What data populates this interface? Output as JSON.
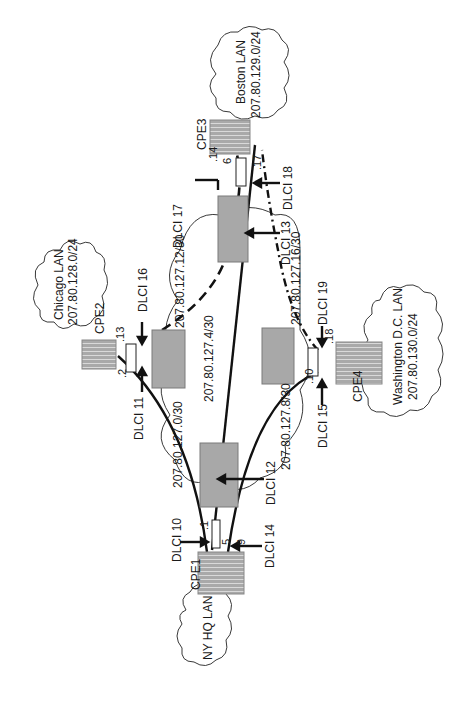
{
  "diagram": {
    "orientation": "rotated 90 degrees counter-clockwise",
    "colors": {
      "device_fill": "#a8a8a8",
      "device_stroke": "#7a7a7a",
      "line": "#111111",
      "background": "#ffffff"
    },
    "lans": [
      {
        "id": "ny",
        "name": "NY HQ LAN",
        "subnet": ""
      },
      {
        "id": "chicago",
        "name": "Chicago LAN",
        "subnet": "207.80.128.0/24"
      },
      {
        "id": "boston",
        "name": "Boston LAN",
        "subnet": "207.80.129.0/24"
      },
      {
        "id": "dc",
        "name": "Washington D.C.  LAN",
        "subnet": "207.80.130.0/24"
      }
    ],
    "cpe": [
      {
        "id": "cpe1",
        "label": "CPE1"
      },
      {
        "id": "cpe2",
        "label": "CPE2"
      },
      {
        "id": "cpe3",
        "label": "CPE3"
      },
      {
        "id": "cpe4",
        "label": "CPE4"
      }
    ],
    "dlci": [
      {
        "label": "DLCI 10"
      },
      {
        "label": "DLCI 11"
      },
      {
        "label": "DLCI 12"
      },
      {
        "label": "DLCI 13"
      },
      {
        "label": "DLCI 14"
      },
      {
        "label": "DLCI 15"
      },
      {
        "label": "DLCI 16"
      },
      {
        "label": "DLCI 17"
      },
      {
        "label": "DLCI 18"
      },
      {
        "label": "DLCI 19"
      }
    ],
    "subnets": [
      {
        "label": "207.80.127.0/30"
      },
      {
        "label": "207.80.127.4/30"
      },
      {
        "label": "207.80.127.8/30"
      },
      {
        "label": "207.80.127.12/30"
      },
      {
        "label": "207.80.127.16/30"
      }
    ],
    "host_ids": {
      "h1": ".1",
      "h5": ".5",
      "h9": ".9",
      "h2": ".2",
      "h13": ".13",
      "h6": "6",
      "h14": ".14",
      "h17": ".17",
      "h10": ".10",
      "h18": ".18"
    }
  }
}
